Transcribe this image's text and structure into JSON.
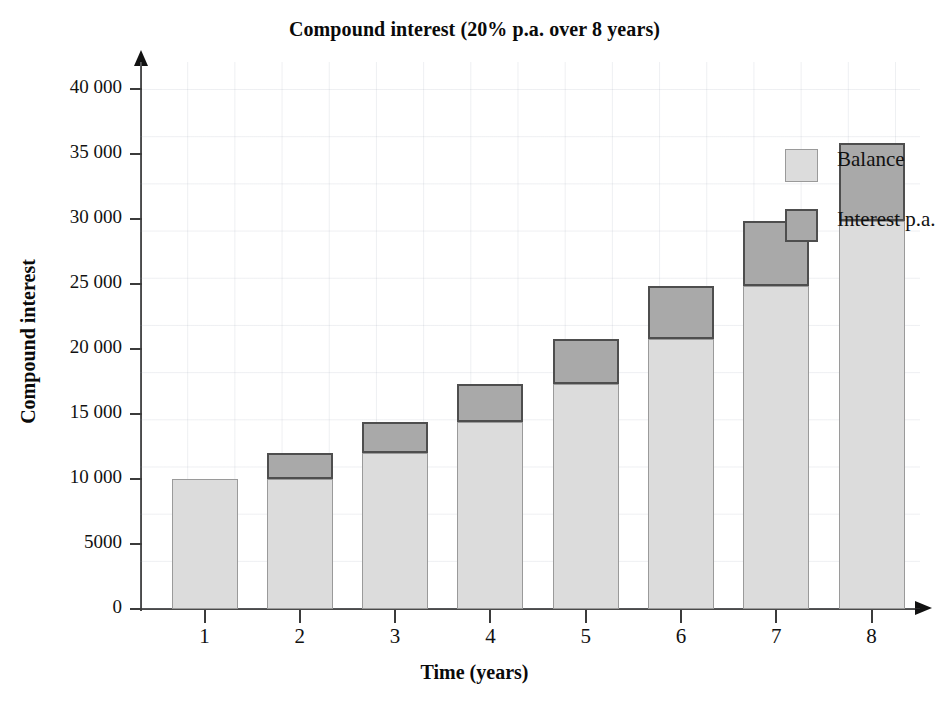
{
  "chart_data": {
    "type": "bar",
    "title": "Compound interest (20% p.a. over 8 years)",
    "xlabel": "Time (years)",
    "ylabel": "Compound interest",
    "categories": [
      "1",
      "2",
      "3",
      "4",
      "5",
      "6",
      "7",
      "8"
    ],
    "ylim": [
      0,
      40000
    ],
    "ytick_values": [
      0,
      5000,
      10000,
      15000,
      20000,
      25000,
      30000,
      35000,
      40000
    ],
    "ytick_labels": [
      "0",
      "5000",
      "10 000",
      "15 000",
      "20 000",
      "25 000",
      "30 000",
      "35 000",
      "40 000"
    ],
    "grid": true,
    "legend_position": "inside-top-right",
    "stacked": true,
    "series": [
      {
        "name": "Balance",
        "color": "#dcdcdc",
        "values": [
          10000,
          10000,
          12000,
          14400,
          17280,
          20736,
          24883,
          29860
        ]
      },
      {
        "name": "Interest p.a.",
        "color": "#a9a9a9",
        "values": [
          0,
          2000,
          2400,
          2880,
          3456,
          4147,
          4977,
          5972
        ]
      }
    ],
    "totals": [
      10000,
      12000,
      14400,
      17280,
      20736,
      24883,
      29860,
      35832
    ]
  },
  "legend": {
    "items": [
      {
        "label": "Balance",
        "swatch": "balance"
      },
      {
        "label": "Interest p.a.",
        "swatch": "interest"
      }
    ]
  }
}
